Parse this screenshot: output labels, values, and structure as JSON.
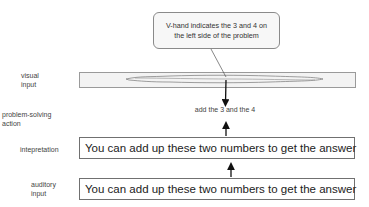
{
  "callout": {
    "text": "V-hand indicates the 3 and 4 on the left side of the problem"
  },
  "labels": {
    "visual_input": [
      "visual",
      "input"
    ],
    "problem_solving_action": [
      "problem-solving",
      "action"
    ],
    "interpretation": "intepretation",
    "auditory_input": [
      "auditory",
      "input"
    ]
  },
  "action": {
    "text": "add the 3 and the 4"
  },
  "interpretation_box": {
    "text": "You can add up these two numbers to get the answer"
  },
  "auditory_box": {
    "text": "You can add up these two numbers to get the answer"
  },
  "colors": {
    "border": "#707070",
    "callout_bg": "#f7f7f7",
    "bar_bg": "#f3f3f3"
  }
}
